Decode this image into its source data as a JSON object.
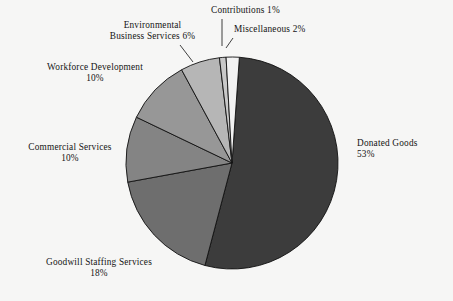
{
  "chart_data": {
    "type": "pie",
    "title": "",
    "legend_position": "callout-labels",
    "total_percent": 100,
    "start_angle_deg": 4,
    "direction": "clockwise",
    "categories": [
      "Donated Goods",
      "Goodwill Staffing Services",
      "Commercial Services",
      "Workforce Development",
      "Environmental Business Services",
      "Contributions",
      "Miscellaneous"
    ],
    "values": [
      53,
      18,
      10,
      10,
      6,
      1,
      2
    ],
    "value_labels": [
      "53%",
      "18%",
      "10%",
      "10%",
      "6%",
      "1%",
      "2%"
    ],
    "colors": [
      "#3c3c3c",
      "#6e6e6e",
      "#848484",
      "#979797",
      "#b6b6b6",
      "#c9c9c9",
      "#f2f2f2"
    ],
    "slices": [
      {
        "name": "Donated Goods",
        "value": 53,
        "value_label": "53%",
        "color": "#3c3c3c",
        "label_lines": [
          "Donated Goods",
          "53%"
        ]
      },
      {
        "name": "Goodwill Staffing Services",
        "value": 18,
        "value_label": "18%",
        "color": "#6e6e6e",
        "label_lines": [
          "Goodwill Staffing Services",
          "18%"
        ]
      },
      {
        "name": "Commercial Services",
        "value": 10,
        "value_label": "10%",
        "color": "#848484",
        "label_lines": [
          "Commercial Services",
          "10%"
        ]
      },
      {
        "name": "Workforce Development",
        "value": 10,
        "value_label": "10%",
        "color": "#979797",
        "label_lines": [
          "Workforce Development",
          "10%"
        ]
      },
      {
        "name": "Environmental Business Services",
        "value": 6,
        "value_label": "6%",
        "color": "#b6b6b6",
        "label_lines": [
          "Environmental",
          "Business Services 6%"
        ]
      },
      {
        "name": "Contributions",
        "value": 1,
        "value_label": "1%",
        "color": "#c9c9c9",
        "label_lines": [
          "Contributions 1%"
        ]
      },
      {
        "name": "Miscellaneous",
        "value": 2,
        "value_label": "2%",
        "color": "#f2f2f2",
        "label_lines": [
          "Miscellaneous 2%"
        ]
      }
    ]
  },
  "labels": {
    "contributions": "Contributions 1%",
    "miscellaneous": "Miscellaneous 2%",
    "environmental_l1": "Environmental",
    "environmental_l2": "Business Services 6%",
    "workforce_l1": "Workforce Development",
    "workforce_l2": "10%",
    "commercial_l1": "Commercial Services",
    "commercial_l2": "10%",
    "goodwill_l1": "Goodwill Staffing Services",
    "goodwill_l2": "18%",
    "donated_l1": "Donated Goods",
    "donated_l2": "53%"
  },
  "geometry": {
    "cx": 232,
    "cy": 163,
    "r": 106
  },
  "style": {
    "background": "#f6f6f5",
    "text_color": "#141414",
    "slice_border": "#111111"
  }
}
